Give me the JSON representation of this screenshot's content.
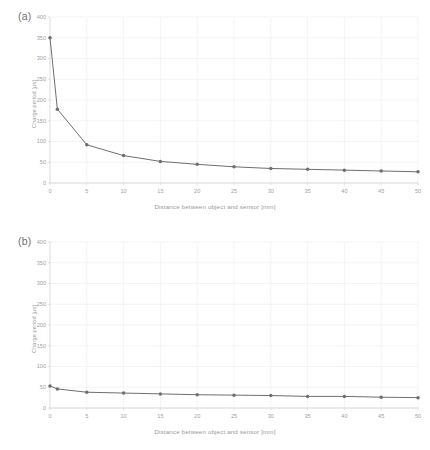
{
  "figure": {
    "background_color": "#ffffff",
    "series_color": "#6f6f6f",
    "grid_color": "#efefef",
    "axis_color": "#d8d8d8",
    "text_color": "#9a9a9a"
  },
  "panels": [
    {
      "id": "a",
      "label": "(a)"
    },
    {
      "id": "b",
      "label": "(b)"
    }
  ],
  "chart_data": [
    {
      "type": "line",
      "panel": "(a)",
      "title": "",
      "xlabel": "Distance between  object and sensor [mm]",
      "ylabel": "Charge period [µs]",
      "xlim": [
        0,
        50
      ],
      "ylim": [
        0,
        400
      ],
      "xticks": [
        0,
        5,
        10,
        15,
        20,
        25,
        30,
        35,
        40,
        45,
        50
      ],
      "yticks": [
        0,
        50,
        100,
        150,
        200,
        250,
        300,
        350,
        400
      ],
      "xtick_labels": [
        "0",
        "5",
        "10",
        "15",
        "20",
        "25",
        "30",
        "35",
        "40",
        "45",
        "50"
      ],
      "ytick_labels": [
        "0",
        "50",
        "100",
        "150",
        "200",
        "250",
        "300",
        "350",
        "400"
      ],
      "grid": true,
      "legend": null,
      "markers": true,
      "x": [
        0,
        1,
        5,
        10,
        15,
        20,
        25,
        30,
        35,
        40,
        45,
        50
      ],
      "values": [
        350,
        178,
        92,
        66,
        52,
        45,
        39,
        35,
        33,
        31,
        29,
        27
      ]
    },
    {
      "type": "line",
      "panel": "(b)",
      "title": "",
      "xlabel": "Distance between  object and sensor [mm]",
      "ylabel": "Charge period [µs]",
      "xlim": [
        0,
        50
      ],
      "ylim": [
        0,
        400
      ],
      "xticks": [
        0,
        5,
        10,
        15,
        20,
        25,
        30,
        35,
        40,
        45,
        50
      ],
      "yticks": [
        0,
        50,
        100,
        150,
        200,
        250,
        300,
        350,
        400
      ],
      "xtick_labels": [
        "0",
        "5",
        "10",
        "15",
        "20",
        "25",
        "30",
        "35",
        "40",
        "45",
        "50"
      ],
      "ytick_labels": [
        "0",
        "50",
        "100",
        "150",
        "200",
        "250",
        "300",
        "350",
        "400"
      ],
      "grid": true,
      "legend": null,
      "markers": true,
      "x": [
        0,
        1,
        5,
        10,
        15,
        20,
        25,
        30,
        35,
        40,
        45,
        50
      ],
      "values": [
        53,
        46,
        38,
        36,
        34,
        32,
        31,
        30,
        28,
        28,
        26,
        25
      ]
    }
  ]
}
